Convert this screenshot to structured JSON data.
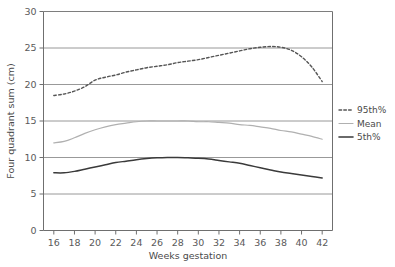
{
  "chart_data": {
    "type": "line",
    "title": "",
    "xlabel": "Weeks gestation",
    "ylabel": "Four quadrant sum (cm)",
    "xlim": [
      15,
      43
    ],
    "ylim": [
      0,
      30
    ],
    "xticks": [
      "16",
      "18",
      "20",
      "22",
      "24",
      "26",
      "28",
      "30",
      "32",
      "34",
      "36",
      "38",
      "40",
      "42"
    ],
    "yticks": [
      "0",
      "5",
      "10",
      "15",
      "20",
      "25",
      "30"
    ],
    "grid": "horizontal",
    "legend_position": "right",
    "x": [
      16,
      17,
      18,
      19,
      20,
      21,
      22,
      23,
      24,
      25,
      26,
      27,
      28,
      29,
      30,
      31,
      32,
      33,
      34,
      35,
      36,
      37,
      38,
      39,
      40,
      41,
      42
    ],
    "series": [
      {
        "name": "95th%",
        "style": "dashed",
        "color": "#555555",
        "values": [
          18.5,
          18.7,
          19.1,
          19.7,
          20.6,
          21.0,
          21.3,
          21.7,
          22.0,
          22.3,
          22.5,
          22.7,
          23.0,
          23.2,
          23.4,
          23.7,
          24.0,
          24.3,
          24.6,
          24.9,
          25.1,
          25.2,
          25.1,
          24.7,
          23.8,
          22.4,
          20.4
        ]
      },
      {
        "name": "Mean",
        "style": "solid",
        "color": "#b0b0b0",
        "values": [
          12.0,
          12.2,
          12.7,
          13.3,
          13.8,
          14.2,
          14.5,
          14.7,
          14.9,
          15.0,
          15.0,
          15.0,
          15.0,
          15.0,
          14.9,
          14.9,
          14.8,
          14.7,
          14.5,
          14.4,
          14.2,
          14.0,
          13.7,
          13.5,
          13.2,
          12.9,
          12.5
        ]
      },
      {
        "name": "5th%",
        "style": "solid",
        "color": "#3a3a3a",
        "values": [
          7.9,
          7.9,
          8.1,
          8.4,
          8.7,
          9.0,
          9.3,
          9.5,
          9.7,
          9.85,
          9.95,
          10.0,
          10.0,
          9.95,
          9.9,
          9.8,
          9.6,
          9.4,
          9.2,
          8.9,
          8.6,
          8.3,
          8.0,
          7.8,
          7.6,
          7.4,
          7.2
        ]
      }
    ]
  },
  "legend": {
    "items": [
      {
        "label": "95th%"
      },
      {
        "label": "Mean"
      },
      {
        "label": "5th%"
      }
    ]
  }
}
